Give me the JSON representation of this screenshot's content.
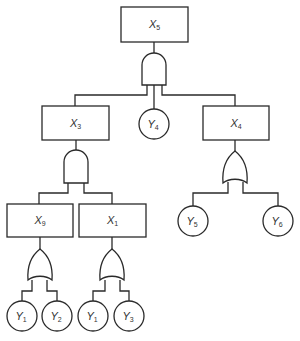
{
  "diagram": {
    "type": "fault-tree",
    "colors": {
      "stroke": "#2a2a2a",
      "background": "#ffffff",
      "text": "#333333"
    },
    "events": [
      {
        "id": "X5",
        "base": "X",
        "sub": "5",
        "kind": "intermediate",
        "x": 121,
        "y": 7,
        "w": 67,
        "h": 35
      },
      {
        "id": "X3",
        "base": "X",
        "sub": "3",
        "kind": "intermediate",
        "x": 42,
        "y": 106,
        "w": 67,
        "h": 34
      },
      {
        "id": "X4",
        "base": "X",
        "sub": "4",
        "kind": "intermediate",
        "x": 203,
        "y": 106,
        "w": 66,
        "h": 34
      },
      {
        "id": "X9",
        "base": "X",
        "sub": "9",
        "kind": "intermediate",
        "x": 7,
        "y": 204,
        "w": 66,
        "h": 33
      },
      {
        "id": "X1",
        "base": "X",
        "sub": "1",
        "kind": "intermediate",
        "x": 79,
        "y": 204,
        "w": 67,
        "h": 33
      }
    ],
    "basic_events": [
      {
        "id": "Y4",
        "base": "Y",
        "sub": "4",
        "cx": 154,
        "cy": 124,
        "r": 15
      },
      {
        "id": "Y5",
        "base": "Y",
        "sub": "5",
        "cx": 193,
        "cy": 221,
        "r": 15
      },
      {
        "id": "Y6",
        "base": "Y",
        "sub": "6",
        "cx": 278,
        "cy": 221,
        "r": 15
      },
      {
        "id": "Y1a",
        "base": "Y",
        "sub": "1",
        "cx": 22,
        "cy": 316,
        "r": 15
      },
      {
        "id": "Y2",
        "base": "Y",
        "sub": "2",
        "cx": 57,
        "cy": 316,
        "r": 15
      },
      {
        "id": "Y1b",
        "base": "Y",
        "sub": "1",
        "cx": 93,
        "cy": 316,
        "r": 15
      },
      {
        "id": "Y3",
        "base": "Y",
        "sub": "3",
        "cx": 129,
        "cy": 316,
        "r": 15
      }
    ],
    "gates": [
      {
        "id": "G-X5",
        "type": "AND",
        "output": "X5",
        "inputs": [
          "X3",
          "Y4",
          "X4"
        ]
      },
      {
        "id": "G-X3",
        "type": "AND",
        "output": "X3",
        "inputs": [
          "X9",
          "X1"
        ]
      },
      {
        "id": "G-X4",
        "type": "OR",
        "output": "X4",
        "inputs": [
          "Y5",
          "Y6"
        ]
      },
      {
        "id": "G-X9",
        "type": "OR",
        "output": "X9",
        "inputs": [
          "Y1",
          "Y2"
        ]
      },
      {
        "id": "G-X1",
        "type": "OR",
        "output": "X1",
        "inputs": [
          "Y1",
          "Y3"
        ]
      }
    ]
  }
}
